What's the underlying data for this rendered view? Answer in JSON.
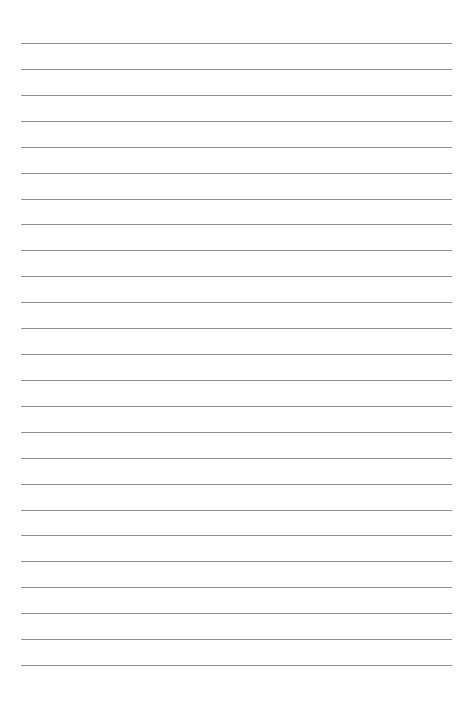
{
  "page": {
    "type": "lined-paper",
    "line_count": 25,
    "first_line_y": 43,
    "line_spacing": 25.92,
    "line_left": 21,
    "line_width": 431,
    "line_color": "#8f8f8f",
    "background_color": "#ffffff"
  }
}
